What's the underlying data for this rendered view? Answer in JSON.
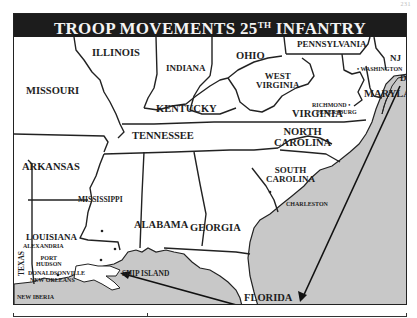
{
  "page": {
    "number": "231"
  },
  "title": {
    "main": "TROOP MOVEMENTS 25",
    "superscript": "TH",
    "suffix": " INFANTRY"
  },
  "colors": {
    "title_bg": "#1c1c1c",
    "water": "#c8c8c8",
    "land": "#ffffff",
    "border": "#222222"
  },
  "states": {
    "illinois": "ILLINOIS",
    "indiana": "INDIANA",
    "ohio": "OHIO",
    "pennsylvania": "PENNSYLVANIA",
    "nj": "NJ",
    "missouri": "MISSOURI",
    "kentucky": "KENTUCKY",
    "west_virginia_1": "WEST",
    "west_virginia_2": "VIRGINIA",
    "virginia": "VIRGINIA",
    "maryland": "MARYLAND",
    "del": "DEL",
    "tennessee": "TENNESSEE",
    "north_carolina_1": "NORTH",
    "north_carolina_2": "CAROLINA",
    "arkansas": "ARKANSAS",
    "mississippi": "MISSISSIPPI",
    "south_carolina_1": "SOUTH",
    "south_carolina_2": "CAROLINA",
    "louisiana": "LOUISIANA",
    "alabama": "ALABAMA",
    "georgia": "GEORGIA",
    "texas": "TEXAS",
    "florida": "FLORIDA"
  },
  "cities": {
    "washington": "• WASHINGTON",
    "richmond": "RICHMOND •",
    "petersburg": "PETERSBURG",
    "charleston": "CHARLESTON",
    "alexandria": "ALEXANDRIA",
    "port_hudson_1": "PORT",
    "port_hudson_2": "HUDSON",
    "donaldsonville": "DONALDSONVILLE",
    "new_orleans": "NEW ORLEANS",
    "ship_island": "SHIP ISLAND",
    "new_iberia": "NEW IBERIA"
  }
}
